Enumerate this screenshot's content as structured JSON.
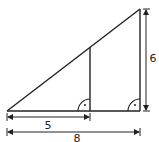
{
  "diagram": {
    "stroke_color": "#222222",
    "background": "#ffffff",
    "labels": {
      "inner_base": "5",
      "outer_base": "8",
      "outer_height": "6"
    },
    "shapes": {
      "large_triangle": {
        "base": 8,
        "height": 6
      },
      "small_triangle": {
        "base": 5,
        "height_unlabeled": true
      },
      "right_angle_markers": 2
    }
  }
}
